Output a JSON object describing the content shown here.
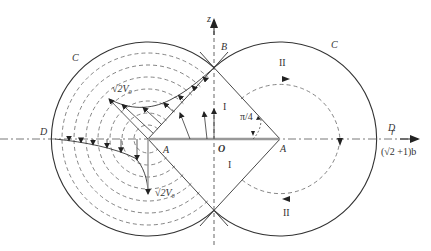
{
  "diagram": {
    "colors": {
      "line": "#333333",
      "axis_dash": "#555555",
      "streamline_dash": "#666666",
      "thick_segment": "#999999"
    },
    "axes": {
      "vertical_label": "z",
      "horizontal_label": "r"
    },
    "labels": {
      "C_left": "C",
      "C_right": "C",
      "B": "B",
      "D_left": "D",
      "D_right": "D",
      "A_left": "A",
      "A_right": "A",
      "O": "O",
      "angle": "π/4",
      "region_I_top": "I",
      "region_I_bottom": "I",
      "region_II_top": "II",
      "region_II_bottom": "II",
      "velocity_top": "√2V₀",
      "velocity_bottom": "√2V₀",
      "radius_value": "(√2 +1)b"
    }
  }
}
